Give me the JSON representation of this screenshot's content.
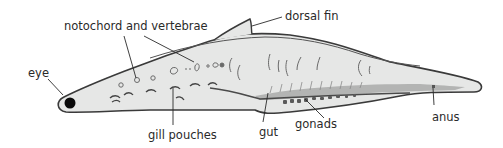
{
  "diagram": {
    "labels": {
      "notochord": "notochord and vertebrae",
      "dorsal_fin": "dorsal fin",
      "eye": "eye",
      "gill_pouches": "gill pouches",
      "gut": "gut",
      "gonads": "gonads",
      "anus": "anus"
    },
    "colors": {
      "body_fill": "#e6e7e6",
      "outline": "#3a3a3a",
      "gut_fill": "#a9aaa9",
      "gonad_fill": "#5a5a5a",
      "eye_fill": "#0a0a0a",
      "text": "#2a2a2a"
    }
  }
}
